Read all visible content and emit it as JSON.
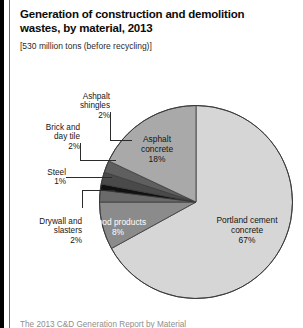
{
  "header": {
    "title": "Generation of construction and demolition wastes, by material, 2013",
    "subtitle": "[530 million tons (before recycling)]"
  },
  "footer": {
    "partial_text": "The 2013 C&D Generation Report by Material"
  },
  "colors": {
    "portland_cement": "#d6d6d6",
    "asphalt_concrete": "#a9a9a9",
    "wood_products": "#8b8b8b",
    "drywall_plasters": "#6a6a6a",
    "steel": "#111111",
    "brick_clay_tile": "#4a4a4a",
    "asphalt_shingles": "#5f5f5f",
    "outline": "#3a3a3a",
    "frame_bar": "#000000",
    "text": "#161616"
  },
  "chart_data": {
    "type": "pie",
    "title": "Generation of construction and demolition wastes, by material, 2013",
    "subtitle": "[530 million tons (before recycling)]",
    "unit": "percent of total tons",
    "total_label": "530 million tons (before recycling)",
    "start_angle_deg": 0,
    "direction": "clockwise",
    "legend": "none (labels on slices and callouts)",
    "grid": false,
    "categories": [
      "Portland cement concrete",
      "Wood products",
      "Drywall and slasters",
      "Steel",
      "Brick and day tile",
      "Ashpalt shingles",
      "Asphalt concrete"
    ],
    "values": [
      67,
      8,
      2,
      1,
      2,
      2,
      18
    ],
    "slices": [
      {
        "name": "Portland cement concrete",
        "value": 67,
        "label": "Portland cement\nconcrete",
        "pct_label": "67%",
        "color": "#d6d6d6",
        "label_placement": "inside",
        "label_color": "dark"
      },
      {
        "name": "Wood products",
        "value": 8,
        "label": "Wood products",
        "pct_label": "8%",
        "color": "#8b8b8b",
        "label_placement": "inside",
        "label_color": "light"
      },
      {
        "name": "Drywall and slasters",
        "value": 2,
        "label": "Drywall and\nslasters",
        "pct_label": "2%",
        "color": "#6a6a6a",
        "label_placement": "callout",
        "label_color": "dark"
      },
      {
        "name": "Steel",
        "value": 1,
        "label": "Steel",
        "pct_label": "1%",
        "color": "#111111",
        "label_placement": "callout",
        "label_color": "dark"
      },
      {
        "name": "Brick and day tile",
        "value": 2,
        "label": "Brick and\nday tile",
        "pct_label": "2%",
        "color": "#4a4a4a",
        "label_placement": "callout",
        "label_color": "dark"
      },
      {
        "name": "Ashpalt shingles",
        "value": 2,
        "label": "Ashpalt\nshingles",
        "pct_label": "2%",
        "color": "#5f5f5f",
        "label_placement": "callout",
        "label_color": "dark"
      },
      {
        "name": "Asphalt concrete",
        "value": 18,
        "label": "Asphalt\nconcrete",
        "pct_label": "18%",
        "color": "#a9a9a9",
        "label_placement": "inside",
        "label_color": "dark"
      }
    ]
  }
}
